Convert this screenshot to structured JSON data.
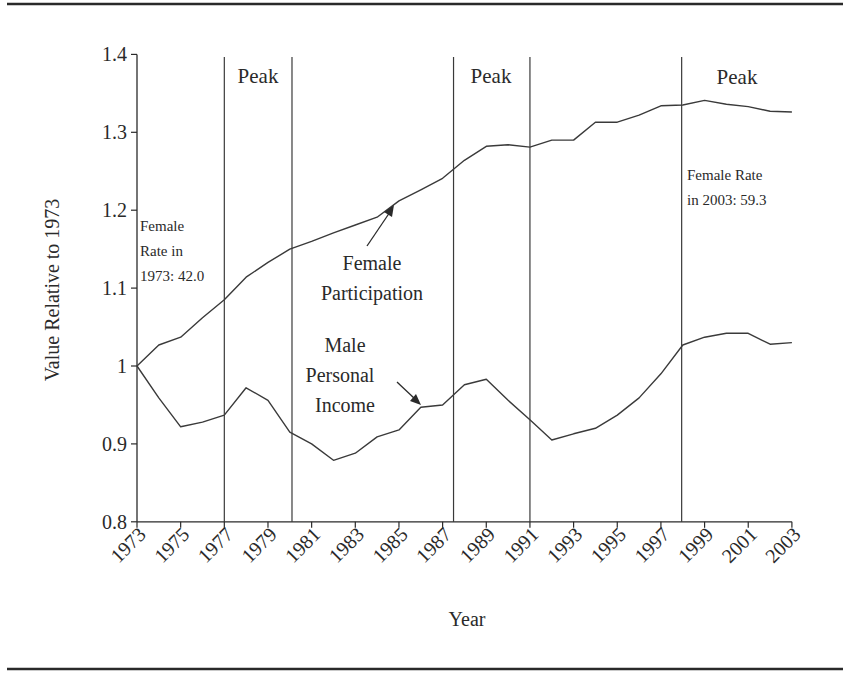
{
  "chart_data": {
    "type": "line",
    "title": "",
    "xlabel": "Year",
    "ylabel": "Value Relative to 1973",
    "ylim": [
      0.8,
      1.4
    ],
    "xlim": [
      1973,
      2003
    ],
    "grid": false,
    "legend": "none (inline labels)",
    "y_ticks": [
      0.8,
      0.9,
      1.0,
      1.1,
      1.2,
      1.3,
      1.4
    ],
    "y_tick_labels": [
      "0.8",
      "0.9",
      "1",
      "1.1",
      "1.2",
      "1.3",
      "1.4"
    ],
    "x_ticks": [
      1973,
      1975,
      1977,
      1979,
      1981,
      1983,
      1985,
      1987,
      1989,
      1991,
      1993,
      1995,
      1997,
      1999,
      2001,
      2003
    ],
    "x_tick_labels": [
      "1973",
      "1975",
      "1977",
      "1979",
      "1981",
      "1983",
      "1985",
      "1987",
      "1989",
      "1991",
      "1993",
      "1995",
      "1997",
      "1999",
      "2001",
      "2003"
    ],
    "x": [
      1973,
      1974,
      1975,
      1976,
      1977,
      1978,
      1979,
      1980,
      1981,
      1982,
      1983,
      1984,
      1985,
      1986,
      1987,
      1988,
      1989,
      1990,
      1991,
      1992,
      1993,
      1994,
      1995,
      1996,
      1997,
      1998,
      1999,
      2000,
      2001,
      2002,
      2003
    ],
    "series": [
      {
        "name": "Female Participation",
        "values": [
          1.0,
          1.027,
          1.037,
          1.062,
          1.085,
          1.114,
          1.133,
          1.15,
          1.16,
          1.171,
          1.181,
          1.191,
          1.212,
          1.226,
          1.241,
          1.264,
          1.282,
          1.284,
          1.281,
          1.29,
          1.29,
          1.313,
          1.313,
          1.322,
          1.334,
          1.335,
          1.341,
          1.336,
          1.333,
          1.327,
          1.326
        ]
      },
      {
        "name": "Male Personal Income",
        "values": [
          1.0,
          0.959,
          0.922,
          0.928,
          0.937,
          0.972,
          0.956,
          0.915,
          0.9,
          0.879,
          0.888,
          0.909,
          0.918,
          0.947,
          0.95,
          0.976,
          0.983,
          0.956,
          0.931,
          0.905,
          0.913,
          0.92,
          0.937,
          0.959,
          0.99,
          1.027,
          1.037,
          1.042,
          1.042,
          1.028,
          1.03
        ]
      }
    ],
    "peak_lines": [
      1977.0,
      1980.1,
      1987.5,
      1991.0,
      1997.95
    ],
    "peak_bands": [
      {
        "label": "Peak",
        "from": 1977.0,
        "to": 1980.1
      },
      {
        "label": "Peak",
        "from": 1987.5,
        "to": 1991.0
      },
      {
        "label": "Peak",
        "from": 1997.95,
        "to": null
      }
    ],
    "annotations": [
      {
        "id": "female-1973",
        "lines": [
          "Female",
          "Rate in",
          "1973: 42.0"
        ]
      },
      {
        "id": "female-2003",
        "lines": [
          "Female Rate",
          "in 2003: 59.3"
        ]
      },
      {
        "id": "female-series-label",
        "lines": [
          "Female",
          "Participation"
        ]
      },
      {
        "id": "male-series-label",
        "lines": [
          "Male",
          "Personal",
          "Income"
        ]
      }
    ]
  },
  "labels": {
    "peak1": "Peak",
    "peak2": "Peak",
    "peak3": "Peak",
    "female1973": [
      "Female",
      "Rate in",
      "1973: 42.0"
    ],
    "female2003": [
      "Female Rate",
      "in 2003: 59.3"
    ],
    "femaleSeries": [
      "Female",
      "Participation"
    ],
    "maleSeries": [
      "Male",
      "Personal",
      "Income"
    ]
  },
  "style": {
    "ink": "#2a2a2a",
    "line": "#3a3a3a",
    "background": "#ffffff"
  }
}
